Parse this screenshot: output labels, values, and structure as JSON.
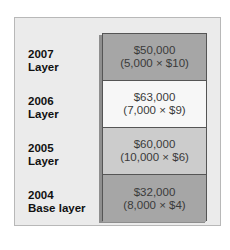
{
  "layers": [
    {
      "year": "2007",
      "name": "Layer",
      "amount": "$50,000",
      "formula": "(5,000 × $10)",
      "color": "#a6a6a6"
    },
    {
      "year": "2006",
      "name": "Layer",
      "amount": "$63,000",
      "formula": "(7,000 × $9)",
      "color": "#f7f7f7"
    },
    {
      "year": "2005",
      "name": "Layer",
      "amount": "$60,000",
      "formula": "(10,000 × $6)",
      "color": "#cccccc"
    },
    {
      "year": "2004",
      "name": "Base layer",
      "amount": "$32,000",
      "formula": "(8,000 × $4)",
      "color": "#a6a6a6"
    }
  ]
}
